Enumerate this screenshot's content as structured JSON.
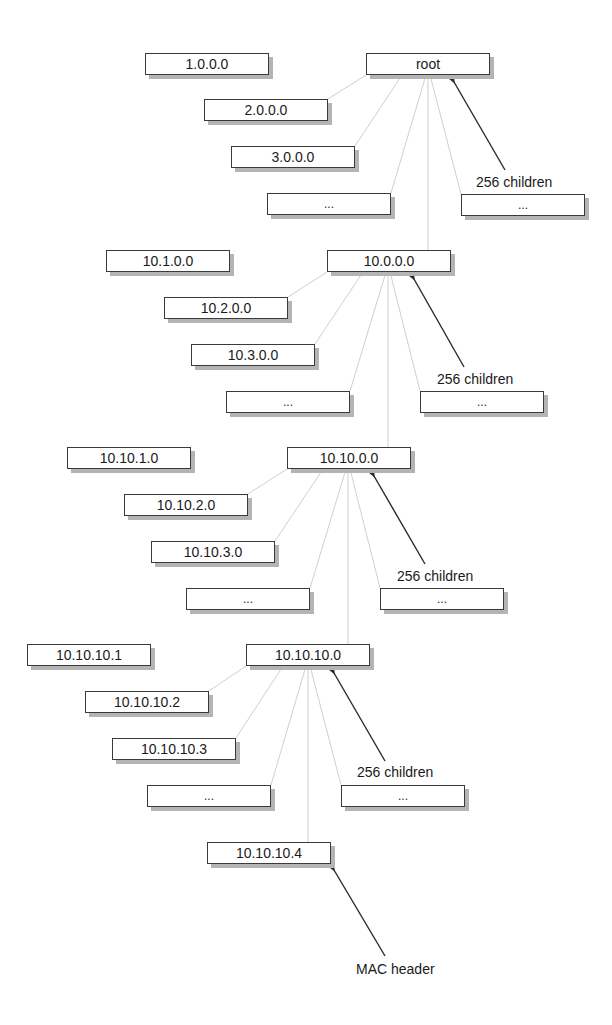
{
  "diagram": {
    "type": "hierarchical address tree",
    "levels": [
      {
        "parent": "root",
        "children": [
          "1.0.0.0",
          "2.0.0.0",
          "3.0.0.0",
          "...",
          "..."
        ],
        "annotation": "256 children"
      },
      {
        "parent": "10.0.0.0",
        "children": [
          "10.1.0.0",
          "10.2.0.0",
          "10.3.0.0",
          "...",
          "..."
        ],
        "annotation": "256 children"
      },
      {
        "parent": "10.10.0.0",
        "children": [
          "10.10.1.0",
          "10.10.2.0",
          "10.10.3.0",
          "...",
          "..."
        ],
        "annotation": "256 children"
      },
      {
        "parent": "10.10.10.0",
        "children": [
          "10.10.10.1",
          "10.10.10.2",
          "10.10.10.3",
          "...",
          "..."
        ],
        "annotation": "256 children"
      }
    ],
    "leaf": {
      "label": "10.10.10.4",
      "annotation": "MAC header"
    }
  },
  "colors": {
    "border": "#3a3a3a",
    "shadow": "#b4b4b4",
    "connector": "#c8c8c8",
    "arrow": "#2a2a2a",
    "text": "#1a1a1a"
  }
}
